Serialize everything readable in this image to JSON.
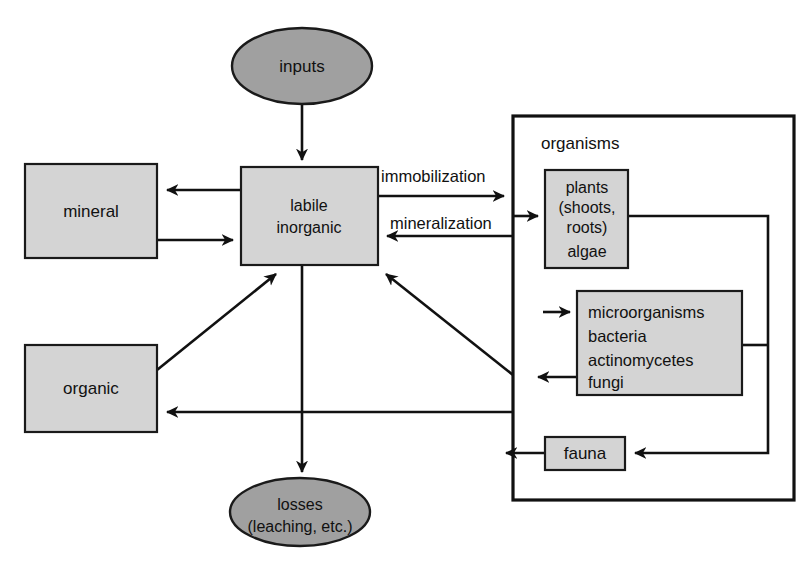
{
  "diagram": {
    "colors": {
      "node_fill": "#d4d4d4",
      "ellipse_fill": "#a0a0a0",
      "stroke": "#111111",
      "background": "#ffffff"
    },
    "nodes": {
      "inputs": {
        "label": "inputs",
        "shape": "ellipse"
      },
      "labile_inorganic": {
        "line1": "labile",
        "line2": "inorganic",
        "shape": "rect"
      },
      "mineral": {
        "label": "mineral",
        "shape": "rect"
      },
      "organic": {
        "label": "organic",
        "shape": "rect"
      },
      "losses": {
        "line1": "losses",
        "line2": "(leaching, etc.)",
        "shape": "ellipse"
      },
      "organisms": {
        "label": "organisms",
        "shape": "container"
      },
      "plants": {
        "line1": "plants",
        "line2": "(shoots,",
        "line3": "roots)",
        "line4": "algae",
        "shape": "rect"
      },
      "microorganisms": {
        "line1": "microorganisms",
        "line2": "bacteria",
        "line3": "actinomycetes",
        "line4": "fungi",
        "shape": "rect"
      },
      "fauna": {
        "label": "fauna",
        "shape": "rect"
      }
    },
    "edge_labels": {
      "immobilization": "immobilization",
      "mineralization": "mineralization"
    }
  }
}
